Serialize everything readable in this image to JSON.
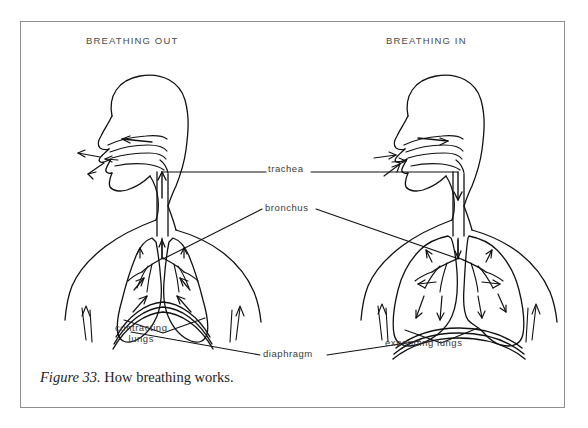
{
  "figure": {
    "caption_number": "Figure 33.",
    "caption_text": "How breathing works.",
    "frame_color": "#8e8e90",
    "ink_color": "#111111",
    "background": "#ffffff"
  },
  "panels": [
    {
      "id": "left",
      "heading": "BREATHING OUT",
      "lung_state_label_line1": "contracting",
      "lung_state_label_line2": "lungs",
      "lung_state": "contracted",
      "diaphragm_state": "raised-domed",
      "airflow_direction": "outward"
    },
    {
      "id": "right",
      "heading": "BREATHING IN",
      "lung_state_label_line1": "expanding lungs",
      "lung_state_label_line2": "",
      "lung_state": "expanded",
      "diaphragm_state": "flattened",
      "airflow_direction": "inward"
    }
  ],
  "labels": {
    "trachea": "trachea",
    "bronchus": "bronchus",
    "diaphragm": "diaphragm"
  }
}
